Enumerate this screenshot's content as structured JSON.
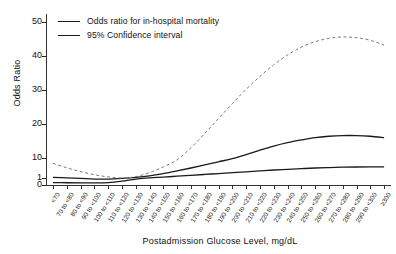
{
  "chart_data": {
    "type": "line",
    "title": "",
    "xlabel": "Postadmission Glucose Level, mg/dL",
    "ylabel": "Odds Ratio",
    "grid": false,
    "legend_position": "top-left",
    "yticks": [
      0,
      1,
      10,
      20,
      30,
      40,
      50
    ],
    "ylim": [
      0,
      50
    ],
    "y_axis_note": "broken axis: 0 and 1 compressed at base, then 10 to 50 linear",
    "categories": [
      "<70",
      "70 to <80",
      "80 to <90",
      "90 to <100",
      "100 to <110",
      "110 to <120",
      "120 to <130",
      "130 to <140",
      "140 to <150",
      "150 to <160",
      "160 to <170",
      "170 to <180",
      "180 to <190",
      "190 to <200",
      "200 to <210",
      "210 to <220",
      "220 to <230",
      "230 to <240",
      "240 to <250",
      "250 to <260",
      "260 to <270",
      "270 to <280",
      "280 to <290",
      "290 to <300",
      "≥300"
    ],
    "series": [
      {
        "name": "Odds ratio for in-hospital mortality",
        "style": "solid",
        "color": "#1a1a1a",
        "values": [
          1.3,
          1.1,
          0.95,
          0.85,
          0.85,
          0.95,
          1.3,
          2.0,
          3.0,
          4.2,
          5.5,
          6.9,
          8.3,
          9.7,
          11.0,
          12.3,
          13.5,
          14.5,
          15.3,
          16.0,
          16.4,
          16.6,
          16.6,
          16.4,
          16.0
        ]
      },
      {
        "name": "95% Confidence interval upper",
        "style": "dashed",
        "color": "#7a7a7a",
        "values": [
          7.6,
          5.6,
          3.9,
          2.5,
          1.5,
          1.0,
          1.6,
          3.4,
          6.0,
          9.2,
          13.0,
          17.2,
          21.6,
          26.0,
          30.2,
          34.0,
          37.4,
          40.3,
          42.6,
          44.2,
          45.2,
          45.6,
          45.4,
          44.6,
          43.2
        ]
      },
      {
        "name": "95% Confidence interval lower",
        "style": "solid",
        "color": "#1a1a1a",
        "values": [
          0.35,
          0.32,
          0.3,
          0.3,
          0.35,
          0.55,
          0.85,
          1.1,
          1.4,
          1.8,
          2.2,
          2.6,
          3.0,
          3.4,
          3.8,
          4.2,
          4.6,
          4.9,
          5.2,
          5.5,
          5.7,
          5.85,
          5.95,
          6.0,
          6.0
        ]
      }
    ]
  },
  "legend": {
    "items": [
      {
        "label": "Odds ratio for in-hospital mortality"
      },
      {
        "label": "95% Confidence interval"
      }
    ]
  }
}
